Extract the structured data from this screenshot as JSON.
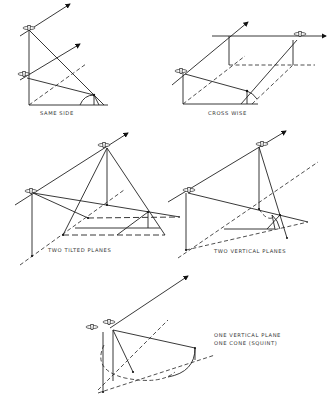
{
  "figure": {
    "panels": [
      {
        "id": "same-side",
        "label": "SAME SIDE"
      },
      {
        "id": "cross-wise",
        "label": "CROSS WISE"
      },
      {
        "id": "two-tilted-planes",
        "label": "TWO TILTED PLANES"
      },
      {
        "id": "two-vertical-planes",
        "label": "TWO VERTICAL PLANES"
      },
      {
        "id": "one-vertical-plane-one-cone",
        "label_line1": "ONE VERTICAL PLANE",
        "label_line2": "ONE CONE (SQUINT)"
      }
    ]
  },
  "colors": {
    "line": "#222222",
    "background": "#ffffff"
  }
}
